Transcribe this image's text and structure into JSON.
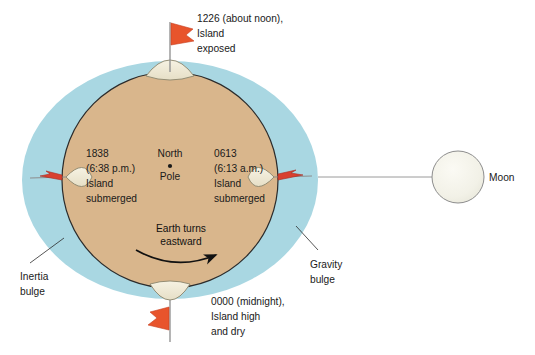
{
  "figure": {
    "background_color": "#ffffff"
  },
  "colors": {
    "ocean_bulge": "#a9d7e2",
    "earth_land": "#d9b68c",
    "earth_outline": "#2b2b2b",
    "island": "#efe9d5",
    "island_outline": "#7d7a63",
    "flag_red": "#e8542c",
    "flag_dark_red": "#bb2f28",
    "moon_fill": "#f2f1e8",
    "moon_outline": "#8d8d8d",
    "moon_line": "#9a9a9a",
    "text": "#1a1a1a"
  },
  "earth": {
    "center_label_line1": "North",
    "center_label_line2": "Pole",
    "pole_dot": "•",
    "rotation_label_line1": "Earth turns",
    "rotation_label_line2": "eastward",
    "rotation_direction": "eastward"
  },
  "positions": [
    {
      "id": "noon",
      "clock": "1226 (about noon),",
      "line2": "Island",
      "line3": "exposed",
      "state": "exposed",
      "location": "top"
    },
    {
      "id": "evening",
      "clock": "1838",
      "line2": "(6:38 p.m.)",
      "line3": "Island",
      "line4": "submerged",
      "state": "submerged",
      "location": "left"
    },
    {
      "id": "morning",
      "clock": "0613",
      "line2": "(6:13 a.m.)",
      "line3": "Island",
      "line4": "submerged",
      "state": "submerged",
      "location": "right"
    },
    {
      "id": "midnight",
      "clock": "0000 (midnight),",
      "line2": "Island high",
      "line3": "and dry",
      "state": "high and dry",
      "location": "bottom"
    }
  ],
  "bulges": [
    {
      "id": "inertia",
      "line1": "Inertia",
      "line2": "bulge",
      "side": "left"
    },
    {
      "id": "gravity",
      "line1": "Gravity",
      "line2": "bulge",
      "side": "right"
    }
  ],
  "moon": {
    "label": "Moon"
  }
}
